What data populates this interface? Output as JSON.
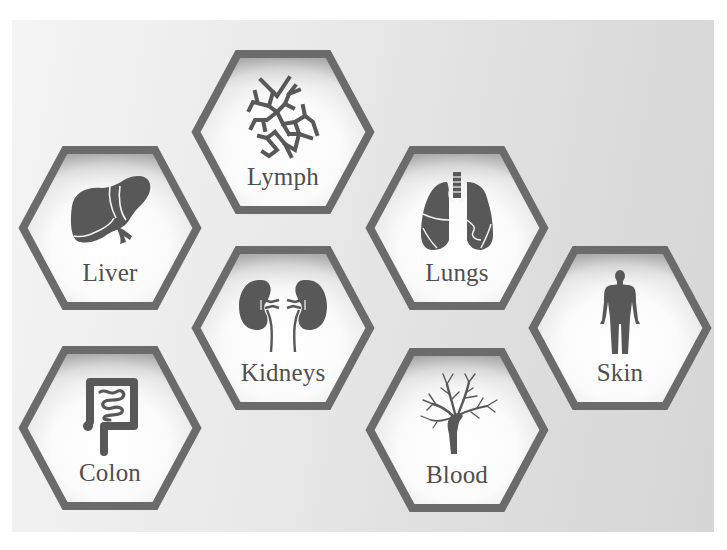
{
  "colors": {
    "hex_border": "#6b6b6b",
    "icon_fill": "#585858",
    "label_text": "#4f4f4f",
    "panel_light": "#f4f4f4",
    "panel_dark": "#d6d6d6"
  },
  "tiles": [
    {
      "id": "lymph",
      "label": "Lymph",
      "icon": "lymph-network-icon",
      "cx": 283,
      "cy": 132
    },
    {
      "id": "liver",
      "label": "Liver",
      "icon": "liver-icon",
      "cx": 110,
      "cy": 228
    },
    {
      "id": "lungs",
      "label": "Lungs",
      "icon": "lungs-icon",
      "cx": 457,
      "cy": 228
    },
    {
      "id": "kidneys",
      "label": "Kidneys",
      "icon": "kidneys-icon",
      "cx": 283,
      "cy": 328
    },
    {
      "id": "skin",
      "label": "Skin",
      "icon": "human-body-icon",
      "cx": 620,
      "cy": 328
    },
    {
      "id": "colon",
      "label": "Colon",
      "icon": "colon-icon",
      "cx": 110,
      "cy": 428
    },
    {
      "id": "blood",
      "label": "Blood",
      "icon": "blood-vessel-tree-icon",
      "cx": 457,
      "cy": 430
    }
  ]
}
